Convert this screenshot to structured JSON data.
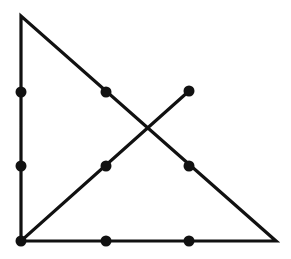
{
  "diagram": {
    "title": "",
    "type": "nine-dot-puzzle-solution",
    "colors": {
      "stroke": "#111111",
      "dot": "#111111",
      "background": "#ffffff"
    },
    "dots": [
      {
        "x": 21,
        "y": 92
      },
      {
        "x": 106,
        "y": 92
      },
      {
        "x": 189,
        "y": 91
      },
      {
        "x": 21,
        "y": 166
      },
      {
        "x": 106,
        "y": 166
      },
      {
        "x": 189,
        "y": 166
      },
      {
        "x": 21,
        "y": 241
      },
      {
        "x": 106,
        "y": 241
      },
      {
        "x": 189,
        "y": 241
      }
    ],
    "path": [
      {
        "x": 189,
        "y": 91
      },
      {
        "x": 21,
        "y": 241
      },
      {
        "x": 21,
        "y": 16
      },
      {
        "x": 276,
        "y": 241
      },
      {
        "x": 21,
        "y": 241
      }
    ],
    "segments": 4
  }
}
